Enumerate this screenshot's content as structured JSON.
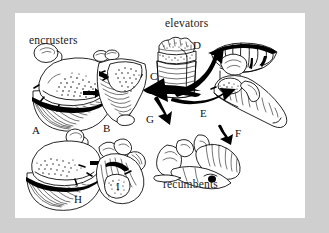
{
  "figure": {
    "background_color": "#cfcfcf",
    "panel_color": "#ffffff",
    "ink_color": "#000000",
    "category_labels": {
      "encrusters": "encrusters",
      "elevators": "elevators",
      "recumbents": "recumbents"
    },
    "specimen_labels": {
      "A": "A",
      "B": "B",
      "C": "C",
      "D": "D",
      "E": "E",
      "F": "F",
      "G": "G",
      "H": "H",
      "I": "I"
    },
    "transitions": [
      {
        "from": "A",
        "to": "B",
        "style": "small-solid-arrow"
      },
      {
        "from": "hub",
        "to": "B",
        "style": "thick-black-arrow"
      },
      {
        "from": "hub",
        "to": "D",
        "style": "thick-curved-arrow"
      },
      {
        "from": "hub",
        "to": "E",
        "style": "thick-curved-arrow"
      },
      {
        "from": "hub",
        "to": "G",
        "style": "thick-short-arrow"
      },
      {
        "from": "E",
        "to": "F",
        "style": "small-solid-arrow"
      },
      {
        "from": "H",
        "to": "I",
        "style": "small-solid-arrow"
      }
    ]
  }
}
